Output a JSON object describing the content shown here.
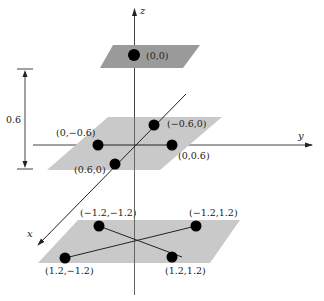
{
  "diagram": {
    "axes": {
      "x_label": "x",
      "y_label": "y",
      "z_label": "z"
    },
    "spacing_annotation": "0.6",
    "colors": {
      "top_plane": "#9a9a9a",
      "lower_planes": "#c9c9c9",
      "points": "#000000",
      "lines": "#222222"
    },
    "planes": [
      {
        "name": "top",
        "points": [
          {
            "label": "(0,0)"
          }
        ]
      },
      {
        "name": "middle",
        "points": [
          {
            "label": "(0,−0.6)"
          },
          {
            "label": "(−0.6,0)"
          },
          {
            "label": "(0,0.6)"
          },
          {
            "label": "(0.6,0)"
          }
        ]
      },
      {
        "name": "bottom",
        "points": [
          {
            "label": "(−1.2,−1.2)"
          },
          {
            "label": "(−1.2,1.2)"
          },
          {
            "label": "(1.2,−1.2)"
          },
          {
            "label": "(1.2,1.2)"
          }
        ]
      }
    ]
  }
}
